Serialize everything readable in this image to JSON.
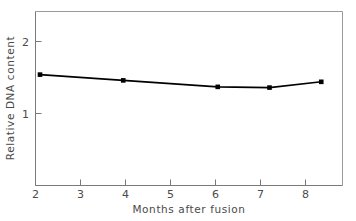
{
  "chart_data": {
    "type": "line",
    "title": "",
    "subtitle": "",
    "xlabel": "Months after fusion",
    "ylabel": "Relative DNA content",
    "xlim": [
      1.75,
      8.6
    ],
    "ylim": [
      0.0,
      2.35
    ],
    "xticks": [
      2,
      3,
      4,
      5,
      6,
      7,
      8
    ],
    "xticklabels": [
      "2",
      "3",
      "4",
      "5",
      "6",
      "7",
      "8"
    ],
    "yticks": [
      1,
      2
    ],
    "yticklabels": [
      "1",
      "2"
    ],
    "grid": false,
    "legend": false,
    "legend_position": "none",
    "series": [
      {
        "name": "Relative DNA content",
        "marker": "square",
        "marker_color": "#000000",
        "line_color": "#000000",
        "x": [
          2.1,
          3.95,
          6.05,
          7.2,
          8.35
        ],
        "y": [
          1.54,
          1.46,
          1.37,
          1.36,
          1.44
        ]
      }
    ],
    "annotations": []
  },
  "colors": {
    "axis": "#8a8a8a",
    "text": "#4a4a4a",
    "line": "#000000",
    "marker": "#000000",
    "background": "#ffffff"
  },
  "axis": {
    "x_title": "Months after fusion",
    "y_title": "Relative DNA content"
  }
}
